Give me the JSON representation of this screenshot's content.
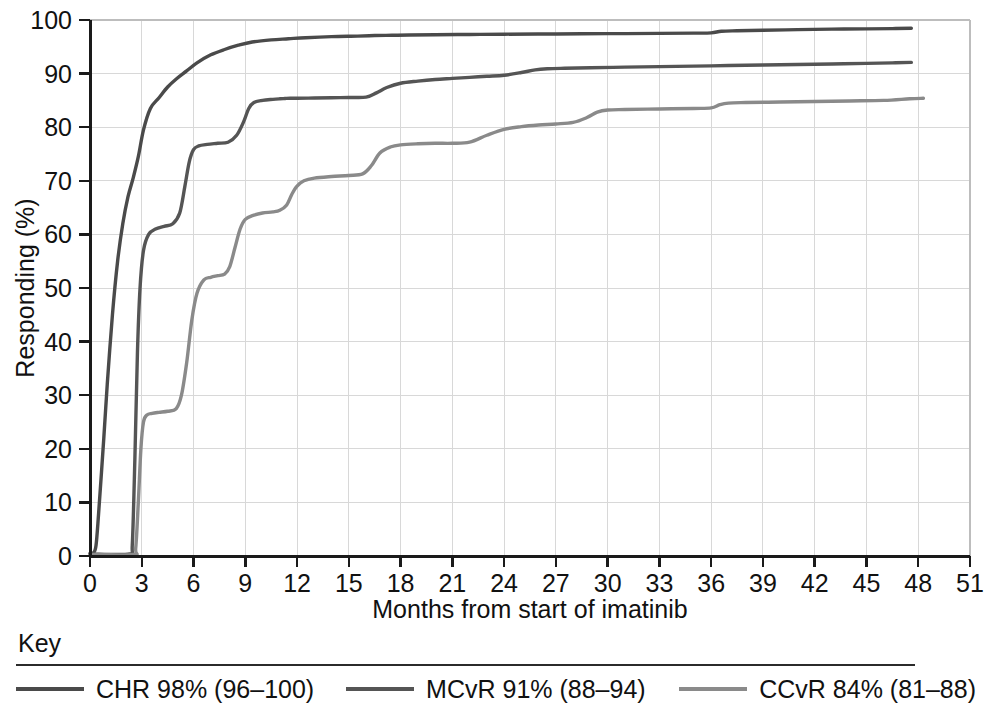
{
  "figure": {
    "key_heading": "Key"
  },
  "chart_data": {
    "type": "line",
    "title": "",
    "subtitle": "",
    "xlabel": "Months from start of imatinib",
    "ylabel": "Responding (%)",
    "xlim": [
      0,
      51
    ],
    "ylim": [
      0,
      100
    ],
    "xticks": [
      0,
      3,
      6,
      9,
      12,
      15,
      18,
      21,
      24,
      27,
      30,
      33,
      36,
      39,
      42,
      45,
      48,
      51
    ],
    "yticks": [
      0,
      10,
      20,
      30,
      40,
      50,
      60,
      70,
      80,
      90,
      100
    ],
    "grid": true,
    "grid_color": "#d8d8d8",
    "legend_position": "below-plot",
    "series": [
      {
        "name": "CHR",
        "legend_label": "CHR 98% (96–100)",
        "color": "#4a4a4a",
        "stroke_width": 3.4,
        "final_value": 98,
        "ci_low": 96,
        "ci_high": 100,
        "x": [
          0,
          0.2,
          0.35,
          0.5,
          0.8,
          1.0,
          1.3,
          1.6,
          1.9,
          2.2,
          2.5,
          2.8,
          3.1,
          3.5,
          4.0,
          4.5,
          5.0,
          5.6,
          6.2,
          7.0,
          7.8,
          8.6,
          9.4,
          10.5,
          11.5,
          12.5,
          14.0,
          15.5,
          16.5,
          17.5,
          18.5,
          20.0,
          22.0,
          24.0,
          27.0,
          30.0,
          33.0,
          35.0,
          36.0,
          36.6,
          37.5,
          39.0,
          41.0,
          43.0,
          45.0,
          46.5,
          47.6
        ],
        "y": [
          0.5,
          0.6,
          2.0,
          8.0,
          22.0,
          32.0,
          45.0,
          55.0,
          62.0,
          67.0,
          70.5,
          74.5,
          79.5,
          83.5,
          85.5,
          87.5,
          89.0,
          90.5,
          92.0,
          93.5,
          94.5,
          95.3,
          95.9,
          96.3,
          96.5,
          96.7,
          96.9,
          97.0,
          97.1,
          97.15,
          97.2,
          97.25,
          97.3,
          97.35,
          97.4,
          97.45,
          97.5,
          97.55,
          97.6,
          97.9,
          98.0,
          98.1,
          98.2,
          98.3,
          98.35,
          98.4,
          98.45
        ]
      },
      {
        "name": "MCvR",
        "legend_label": "MCvR 91% (88–94)",
        "color": "#555555",
        "stroke_width": 3.4,
        "final_value": 91,
        "ci_low": 88,
        "ci_high": 94,
        "x": [
          0,
          2.3,
          2.45,
          2.6,
          2.75,
          2.9,
          3.1,
          3.4,
          3.8,
          4.3,
          4.8,
          5.2,
          5.5,
          5.75,
          6.0,
          6.3,
          6.8,
          7.4,
          8.0,
          8.5,
          8.9,
          9.2,
          9.5,
          10.0,
          10.6,
          11.0,
          11.3,
          11.6,
          12.0,
          13.0,
          14.0,
          15.0,
          16.0,
          16.6,
          17.2,
          18.0,
          19.0,
          20.0,
          21.0,
          22.0,
          23.0,
          24.0,
          25.0,
          25.8,
          26.5,
          27.5,
          29.0,
          31.0,
          33.0,
          35.0,
          37.0,
          39.0,
          41.0,
          43.0,
          45.0,
          46.5,
          47.6
        ],
        "y": [
          0.4,
          0.4,
          2.0,
          18.0,
          38.0,
          50.0,
          57.0,
          60.0,
          61.0,
          61.5,
          62.0,
          64.0,
          69.0,
          73.5,
          75.8,
          76.5,
          76.8,
          77.0,
          77.2,
          78.5,
          81.0,
          83.5,
          84.6,
          85.0,
          85.2,
          85.3,
          85.35,
          85.4,
          85.4,
          85.45,
          85.5,
          85.55,
          85.6,
          86.4,
          87.4,
          88.2,
          88.6,
          88.9,
          89.1,
          89.3,
          89.5,
          89.7,
          90.2,
          90.7,
          90.9,
          91.0,
          91.1,
          91.2,
          91.3,
          91.4,
          91.5,
          91.6,
          91.7,
          91.8,
          91.9,
          92.0,
          92.1
        ]
      },
      {
        "name": "CCvR",
        "legend_label": "CCvR 84% (81–88)",
        "color": "#8a8a8a",
        "stroke_width": 3.4,
        "final_value": 84,
        "ci_low": 81,
        "ci_high": 88,
        "x": [
          0,
          2.5,
          2.65,
          2.8,
          2.95,
          3.1,
          3.3,
          3.6,
          4.0,
          4.5,
          5.0,
          5.3,
          5.6,
          5.9,
          6.2,
          6.6,
          7.0,
          7.4,
          7.8,
          8.1,
          8.4,
          8.7,
          9.0,
          9.5,
          10.0,
          10.6,
          11.0,
          11.4,
          11.7,
          12.0,
          12.4,
          13.0,
          14.0,
          15.0,
          15.8,
          16.3,
          16.8,
          17.4,
          18.0,
          19.0,
          20.0,
          21.0,
          22.0,
          23.0,
          24.0,
          25.0,
          26.0,
          27.0,
          28.0,
          28.8,
          29.4,
          30.0,
          31.0,
          33.0,
          35.0,
          36.0,
          36.5,
          37.0,
          38.0,
          40.0,
          42.0,
          44.0,
          46.0,
          47.5,
          48.3
        ],
        "y": [
          0.3,
          0.3,
          1.5,
          10.0,
          20.0,
          25.0,
          26.3,
          26.6,
          26.8,
          27.0,
          27.5,
          30.0,
          36.0,
          44.0,
          49.0,
          51.5,
          52.0,
          52.3,
          52.6,
          54.0,
          57.5,
          61.0,
          62.8,
          63.6,
          64.0,
          64.2,
          64.5,
          65.5,
          67.5,
          69.0,
          70.0,
          70.5,
          70.8,
          71.0,
          71.3,
          72.8,
          75.2,
          76.3,
          76.7,
          76.9,
          77.0,
          77.0,
          77.2,
          78.5,
          79.6,
          80.1,
          80.4,
          80.6,
          80.9,
          81.8,
          82.8,
          83.2,
          83.3,
          83.4,
          83.5,
          83.6,
          84.2,
          84.5,
          84.6,
          84.7,
          84.8,
          84.9,
          85.0,
          85.3,
          85.4
        ]
      }
    ]
  }
}
